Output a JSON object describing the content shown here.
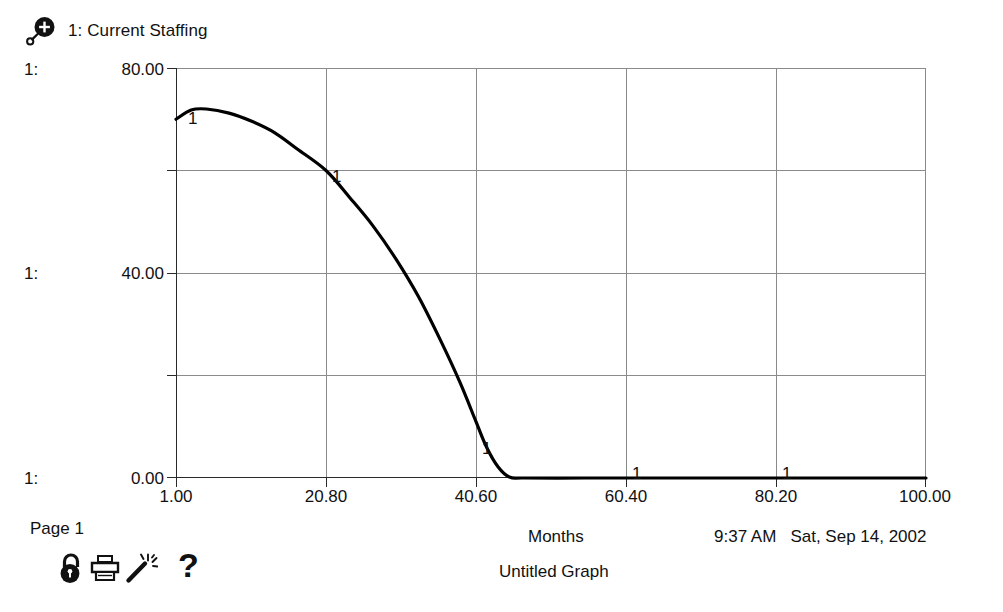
{
  "legend": {
    "icon": "zoom-in-icon",
    "label": "1: Current Staffing"
  },
  "y_axis": {
    "series_prefix": "1:",
    "labels": [
      "80.00",
      "40.00",
      "0.00"
    ]
  },
  "x_axis": {
    "title": "Months",
    "labels": [
      "1.00",
      "20.80",
      "40.60",
      "60.40",
      "80.20",
      "100.00"
    ]
  },
  "markers": {
    "label": "1",
    "count": 5
  },
  "footer": {
    "page": "Page 1",
    "graph_title": "Untitled Graph",
    "time": "9:37 AM",
    "date": "Sat, Sep 14, 2002",
    "help": "?"
  },
  "toolbar": {
    "items": [
      {
        "name": "lock-icon",
        "label": "Lock"
      },
      {
        "name": "printer-icon",
        "label": "Print"
      },
      {
        "name": "magic-wand-icon",
        "label": "Magic Wand"
      }
    ]
  },
  "colors": {
    "ink": "#111111",
    "grid": "#8a8a8a",
    "axis": "#2a2a2a",
    "curve": "#000000",
    "background": "#ffffff"
  },
  "chart_data": {
    "type": "line",
    "title": "Untitled Graph",
    "xlabel": "Months",
    "ylabel": "",
    "xlim": [
      1.0,
      100.0
    ],
    "ylim": [
      0.0,
      80.0
    ],
    "grid": true,
    "legend_position": "top-left",
    "xticks": [
      1.0,
      20.8,
      40.6,
      60.4,
      80.2,
      100.0
    ],
    "yticks": [
      0.0,
      20.0,
      40.0,
      60.0,
      80.0
    ],
    "ytick_labels_shown": [
      "0.00",
      "40.00",
      "80.00"
    ],
    "marker_x": [
      1.0,
      20.8,
      40.6,
      60.4,
      80.2
    ],
    "series": [
      {
        "name": "1: Current Staffing",
        "marker_label": "1",
        "x": [
          1.0,
          3.0,
          5.0,
          8.0,
          11.0,
          14.0,
          17.0,
          20.8,
          24.0,
          27.0,
          30.0,
          33.0,
          36.0,
          38.5,
          40.6,
          42.0,
          43.5,
          45.0,
          47.0,
          55.0,
          60.4,
          70.0,
          80.2,
          90.0,
          100.0
        ],
        "y": [
          70.0,
          71.8,
          72.0,
          71.2,
          69.6,
          67.4,
          64.2,
          60.0,
          54.6,
          49.2,
          42.8,
          35.4,
          26.6,
          18.6,
          11.0,
          6.0,
          2.2,
          0.2,
          0.0,
          0.0,
          0.0,
          0.0,
          0.0,
          0.0,
          0.0
        ]
      }
    ]
  }
}
